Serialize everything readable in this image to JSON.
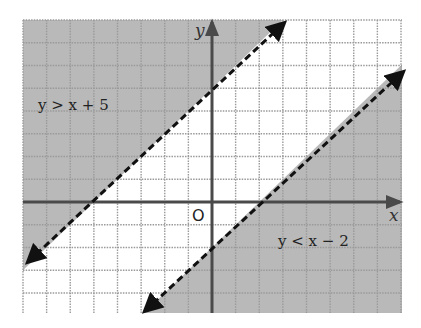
{
  "chart_data": {
    "type": "line",
    "title": "",
    "xlabel": "x",
    "ylabel": "y",
    "origin_label": "O",
    "xlim": [
      -8,
      8
    ],
    "ylim": [
      -5,
      8
    ],
    "grid": true,
    "grid_step": 1,
    "series": [
      {
        "name": "y > x + 5",
        "equation": "y = x + 5",
        "inequality": ">",
        "line_style": "dashed",
        "shaded_region": "above",
        "points": [
          [
            -8,
            -3
          ],
          [
            3,
            8
          ]
        ],
        "label": "y > x + 5"
      },
      {
        "name": "y < x - 2",
        "equation": "y = x - 2",
        "inequality": "<",
        "line_style": "dashed",
        "shaded_region": "below",
        "points": [
          [
            -3,
            -5
          ],
          [
            8,
            6
          ]
        ],
        "label": "y < x − 2"
      }
    ]
  },
  "colors": {
    "shade": "#b9b9b9",
    "grid": "#9a9a9a",
    "axis": "#4a4a4a",
    "line": "#111111",
    "background": "#ffffff"
  },
  "labels": {
    "upper_region": "y > x + 5",
    "lower_region": "y < x − 2",
    "x_axis": "x",
    "y_axis": "y",
    "origin": "O"
  }
}
